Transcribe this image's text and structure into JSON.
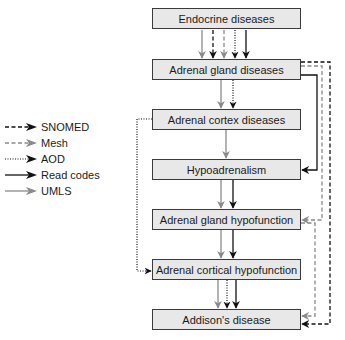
{
  "diagram": {
    "nodes": [
      {
        "id": "endocrine",
        "label": "Endocrine diseases",
        "top": 8
      },
      {
        "id": "adrenal-gland",
        "label": "Adrenal gland diseases",
        "top": 59
      },
      {
        "id": "adrenal-cortex",
        "label": "Adrenal cortex diseases",
        "top": 109
      },
      {
        "id": "hypoadrenalism",
        "label": "Hypoadrenalism",
        "top": 159
      },
      {
        "id": "adrenal-gland-hypofunction",
        "label": "Adrenal gland hypofunction",
        "top": 209
      },
      {
        "id": "adrenal-cortical-hypofunction",
        "label": "Adrenal cortical hypofunction",
        "top": 259
      },
      {
        "id": "addisons",
        "label": "Addison's disease",
        "top": 309
      }
    ],
    "legend": [
      {
        "label": "SNOMED",
        "style": "dashed",
        "color": "#111111"
      },
      {
        "label": "Mesh",
        "style": "dashed",
        "color": "#8a8a8a"
      },
      {
        "label": "AOD",
        "style": "dotted",
        "color": "#111111"
      },
      {
        "label": "Read codes",
        "style": "solid",
        "color": "#111111"
      },
      {
        "label": "UMLS",
        "style": "solid",
        "color": "#8a8a8a"
      }
    ],
    "edges": [
      {
        "from": "endocrine",
        "to": "adrenal-gland",
        "sources": [
          "UMLS",
          "SNOMED",
          "Mesh",
          "AOD",
          "Read codes"
        ]
      },
      {
        "from": "adrenal-gland",
        "to": "adrenal-cortex",
        "sources": [
          "UMLS",
          "AOD"
        ]
      },
      {
        "from": "adrenal-cortex",
        "to": "hypoadrenalism",
        "sources": [
          "UMLS"
        ]
      },
      {
        "from": "hypoadrenalism",
        "to": "adrenal-gland-hypofunction",
        "sources": [
          "UMLS",
          "Read codes"
        ]
      },
      {
        "from": "adrenal-gland-hypofunction",
        "to": "adrenal-cortical-hypofunction",
        "sources": [
          "UMLS",
          "Read codes"
        ]
      },
      {
        "from": "adrenal-cortical-hypofunction",
        "to": "addisons",
        "sources": [
          "UMLS",
          "AOD",
          "Read codes"
        ]
      },
      {
        "from": "adrenal-gland",
        "to": "hypoadrenalism",
        "sources": [
          "Read codes"
        ]
      },
      {
        "from": "adrenal-gland",
        "to": "adrenal-gland-hypofunction",
        "sources": [
          "Mesh"
        ]
      },
      {
        "from": "adrenal-gland-hypofunction",
        "to": "addisons",
        "sources": [
          "Mesh"
        ]
      },
      {
        "from": "adrenal-gland",
        "to": "addisons",
        "sources": [
          "SNOMED"
        ]
      },
      {
        "from": "adrenal-cortex",
        "to": "adrenal-cortical-hypofunction",
        "sources": [
          "AOD"
        ]
      }
    ]
  },
  "colors": {
    "node_fill": "#e8e8e8",
    "node_border": "#3a3a3a",
    "black": "#111111",
    "grey": "#8a8a8a"
  }
}
